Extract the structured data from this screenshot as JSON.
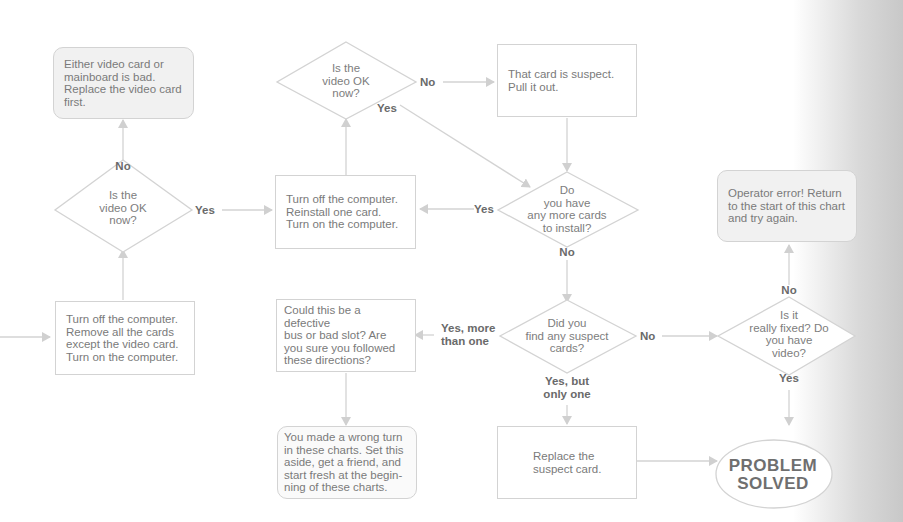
{
  "diagram": {
    "type": "flowchart",
    "nodes": {
      "replace_video_card": "Either video card or\nmainboard is bad.\nReplace the video card\nfirst.",
      "decision_video_ok_left": "Is the\nvideo OK\nnow?",
      "remove_cards": "Turn off the computer.\nRemove all the cards\nexcept the video card.\nTurn on the computer.",
      "decision_video_ok_top": "Is the\nvideo OK\nnow?",
      "card_suspect": "That card is suspect.\nPull it out.",
      "reinstall_card": "Turn off the computer.\nReinstall one card.\nTurn on the computer.",
      "decision_more_cards": "Do\nyou have\nany more cards\nto install?",
      "operator_error": "Operator error!  Return\nto the start of this chart\nand try again.",
      "defective_bus": "Could this be a defective\nbus or bad slot?  Are\nyou sure you followed\nthese directions?",
      "decision_suspect_cards": "Did you\nfind any suspect\ncards?",
      "decision_really_fixed": "Is it\nreally fixed?  Do\nyou have\nvideo?",
      "wrong_turn": "You made a wrong turn\nin these charts.  Set this\naside, get a friend, and\nstart fresh at the begin-\nning of these charts.",
      "replace_suspect": "Replace the\nsuspect card.",
      "problem_solved": "PROBLEM\nSOLVED"
    },
    "labels": {
      "left_no": "No",
      "left_yes": "Yes",
      "top_no": "No",
      "top_yes": "Yes",
      "more_yes": "Yes",
      "more_no": "No",
      "suspect_yes_more": "Yes, more\nthan one",
      "suspect_no": "No",
      "suspect_yes_one": "Yes, but\nonly one",
      "fixed_no": "No",
      "fixed_yes": "Yes"
    },
    "colors": {
      "line": "#d0d0d0",
      "text": "#7a7a7a",
      "label": "#6a6a6a",
      "rounded_fill": "#f1f1f1"
    }
  }
}
